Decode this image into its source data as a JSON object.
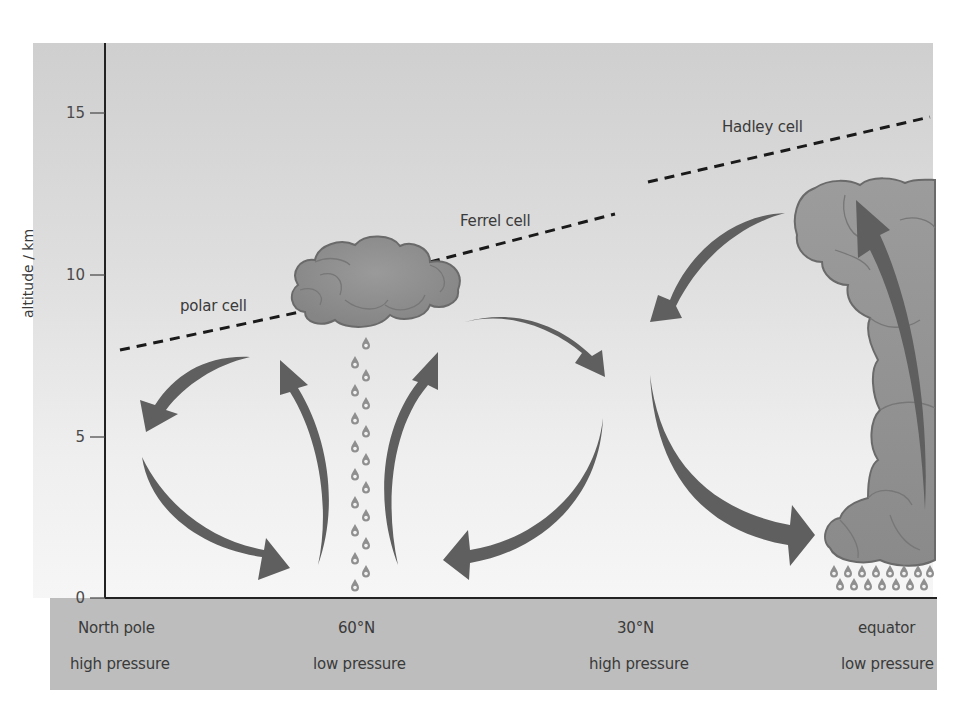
{
  "diagram": {
    "y_axis": {
      "label": "altitude / km",
      "ticks": [
        {
          "value": "0",
          "y": 598
        },
        {
          "value": "5",
          "y": 437
        },
        {
          "value": "10",
          "y": 275
        },
        {
          "value": "15",
          "y": 113
        }
      ]
    },
    "cells": {
      "polar": "polar cell",
      "ferrel": "Ferrel cell",
      "hadley": "Hadley cell"
    },
    "latitudes": [
      {
        "name": "North pole",
        "pressure": "high pressure"
      },
      {
        "name": "60°N",
        "pressure": "low pressure"
      },
      {
        "name": "30°N",
        "pressure": "high pressure"
      },
      {
        "name": "equator",
        "pressure": "low pressure"
      }
    ],
    "colors": {
      "sky_top": "#cfcfcf",
      "sky_bottom": "#f6f6f6",
      "ground": "#bdbdbd",
      "arrow": "#5f5f5f",
      "cloud_fill": "#8e8e8e",
      "cloud_outline": "#6a6a6a",
      "axis": "#222222"
    }
  }
}
